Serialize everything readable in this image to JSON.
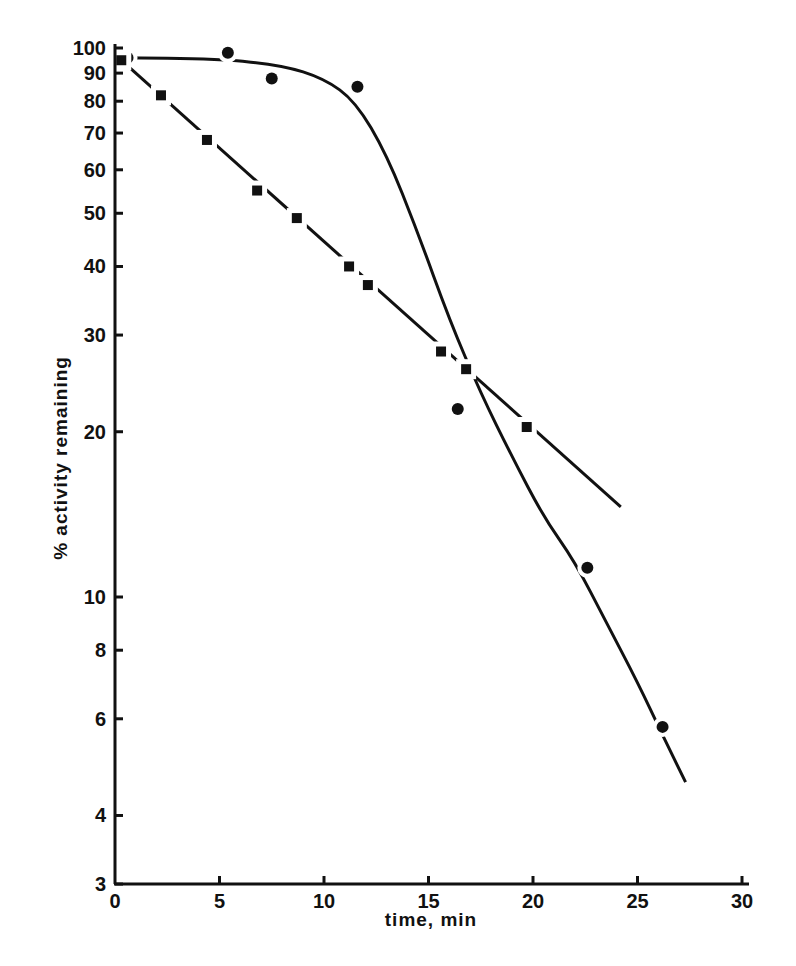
{
  "chart_data": {
    "type": "scatter",
    "title": "",
    "xlabel": "time, min",
    "ylabel": "% activity remaining",
    "xlim": [
      0,
      30
    ],
    "ylim": [
      3,
      100
    ],
    "yscale": "log",
    "grid": false,
    "legend": null,
    "x_ticks": [
      0,
      5,
      10,
      15,
      20,
      25,
      30
    ],
    "x_tick_labels": [
      "0",
      "5",
      "10",
      "15",
      "20",
      "25",
      "30"
    ],
    "y_ticks": [
      3,
      4,
      6,
      8,
      10,
      20,
      30,
      40,
      50,
      60,
      70,
      80,
      90,
      100
    ],
    "y_tick_labels": [
      "3",
      "4",
      "6",
      "8",
      "10",
      "20",
      "30",
      "40",
      "50",
      "60",
      "70",
      "80",
      "90",
      "100"
    ],
    "series": [
      {
        "name": "circles",
        "marker": "circle",
        "line": "sigmoidal fitted curve (solid, broken near points)",
        "x": [
          0.6,
          5.4,
          7.5,
          11.6,
          16.4,
          22.6,
          26.2
        ],
        "y": [
          96,
          98,
          88,
          85,
          22,
          11.3,
          5.8
        ],
        "fit_curve": {
          "x": [
            0,
            5,
            8,
            10,
            11.5,
            13,
            14.5,
            16,
            17.5,
            19,
            20.5,
            22,
            23.5,
            25,
            26.2,
            27.3
          ],
          "y": [
            96,
            95.5,
            93,
            88,
            80,
            64,
            46,
            32,
            23.5,
            18,
            14,
            11.6,
            9,
            7,
            5.6,
            4.6
          ]
        }
      },
      {
        "name": "squares",
        "marker": "square",
        "line": "straight fitted line (solid, broken near points)",
        "x": [
          0.3,
          2.2,
          4.4,
          6.8,
          8.7,
          11.2,
          12.1,
          15.6,
          16.8,
          19.7
        ],
        "y": [
          95,
          82,
          68,
          55,
          49,
          40,
          37,
          28,
          26,
          20.4
        ],
        "fit_line": {
          "x": [
            0.3,
            24.2
          ],
          "y": [
            95,
            14.6
          ]
        }
      }
    ]
  },
  "axes": {
    "x_title": "time, min",
    "y_title": "% activity remaining"
  },
  "colors": {
    "ink": "#111111",
    "background": "#ffffff"
  }
}
